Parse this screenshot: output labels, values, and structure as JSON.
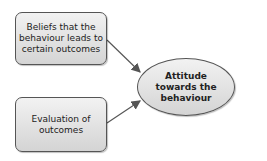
{
  "diagram": {
    "nodes": [
      {
        "id": "beliefs",
        "label": "Beliefs that the behaviour leads to certain outcomes",
        "shape": "rounded-rect"
      },
      {
        "id": "evaluation",
        "label": "Evaluation of outcomes",
        "shape": "rounded-rect"
      },
      {
        "id": "attitude",
        "label": "Attitude towards the behaviour",
        "shape": "ellipse"
      }
    ],
    "edges": [
      {
        "from": "beliefs",
        "to": "attitude"
      },
      {
        "from": "evaluation",
        "to": "attitude"
      }
    ],
    "colors": {
      "stroke": "#555555",
      "fill_top": "#f2f2f2",
      "fill_bottom": "#d4d4d4",
      "text": "#222222"
    }
  }
}
